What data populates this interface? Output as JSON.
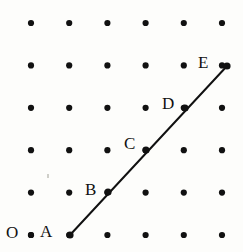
{
  "figure": {
    "type": "dot-grid-line-diagram",
    "width": 243,
    "height": 252,
    "background_color": "#fdfdfb",
    "ink_color": "#111111"
  },
  "grid": {
    "rows": 6,
    "cols": 6,
    "x_start": 31,
    "y_start": 23,
    "x_spacing": 38.2,
    "y_spacing": 42.4,
    "dot_radius": 3.1,
    "dot_color": "#111111"
  },
  "line": {
    "stroke_color": "#111111",
    "stroke_width": 2.0,
    "x1": 70,
    "y1": 235,
    "x2": 227,
    "y2": 66
  },
  "points": [
    {
      "id": "O",
      "label": "O",
      "cx": 31,
      "cy": 235,
      "label_x": 6,
      "label_y": 224,
      "on_line": false,
      "marker": true
    },
    {
      "id": "A",
      "label": "A",
      "cx": 70,
      "cy": 235,
      "label_x": 40,
      "label_y": 223,
      "on_line": true,
      "marker": true
    },
    {
      "id": "B",
      "label": "B",
      "cx": 108,
      "cy": 192,
      "label_x": 85,
      "label_y": 181,
      "on_line": true,
      "marker": true
    },
    {
      "id": "C",
      "label": "C",
      "cx": 146,
      "cy": 150,
      "label_x": 124,
      "label_y": 135,
      "on_line": true,
      "marker": true
    },
    {
      "id": "D",
      "label": "D",
      "cx": 185,
      "cy": 108,
      "label_x": 162,
      "label_y": 95,
      "on_line": true,
      "marker": true
    },
    {
      "id": "E",
      "label": "E",
      "cx": 227,
      "cy": 66,
      "label_x": 198,
      "label_y": 54,
      "on_line": true,
      "marker": true
    }
  ],
  "specks": [
    {
      "x": 47,
      "y": 174,
      "w": 2,
      "h": 4
    }
  ]
}
